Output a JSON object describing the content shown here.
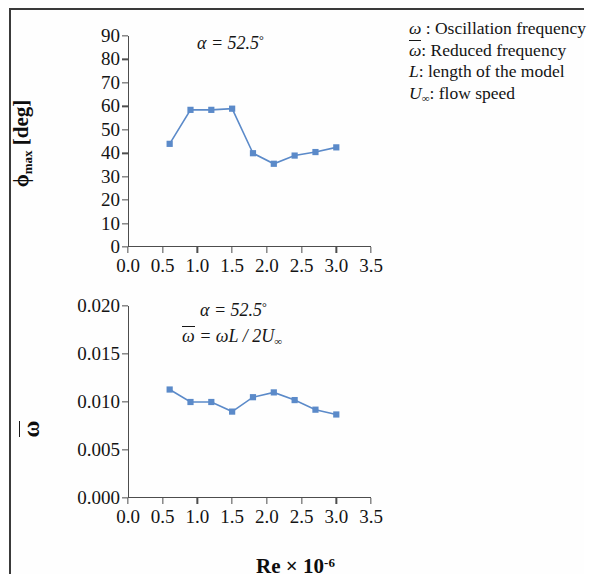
{
  "figure": {
    "legend": [
      {
        "symbol": "ω",
        "overbar": false,
        "subscript": "",
        "text": " : Oscillation frequency"
      },
      {
        "symbol": "ω",
        "overbar": true,
        "subscript": "",
        "text": ": Reduced frequency"
      },
      {
        "symbol": "L",
        "overbar": false,
        "subscript": "",
        "text": ": length of the model"
      },
      {
        "symbol": "U",
        "overbar": false,
        "subscript": "∞",
        "text": ": flow speed"
      }
    ],
    "xaxis_main_label": "Re × 10",
    "xaxis_main_exponent": "-6"
  },
  "chart_data": [
    {
      "type": "line",
      "id": "phi-max-chart",
      "title": "",
      "xlabel": "Re × 10^-6",
      "ylabel": "φmax [deg]",
      "ylabel_base": "ϕ",
      "ylabel_sub": "max",
      "ylabel_unit": "[deg]",
      "annotations": [
        "α = 52.5°"
      ],
      "annotation_alpha": "α = 52.5",
      "annotation_alpha_deg": "°",
      "xlim": [
        0.0,
        3.5
      ],
      "ylim": [
        0,
        90
      ],
      "xticks": [
        "0.0",
        "0.5",
        "1.0",
        "1.5",
        "2.0",
        "2.5",
        "3.0",
        "3.5"
      ],
      "xtick_values": [
        0.0,
        0.5,
        1.0,
        1.5,
        2.0,
        2.5,
        3.0,
        3.5
      ],
      "yticks": [
        "0",
        "10",
        "20",
        "30",
        "40",
        "50",
        "60",
        "70",
        "80",
        "90"
      ],
      "ytick_values": [
        0,
        10,
        20,
        30,
        40,
        50,
        60,
        70,
        80,
        90
      ],
      "grid": false,
      "legend_position": "none",
      "series_color": "#5b8ac9",
      "marker": "square",
      "x": [
        0.6,
        0.9,
        1.2,
        1.5,
        1.8,
        2.1,
        2.4,
        2.7,
        3.0
      ],
      "values": [
        44.0,
        58.5,
        58.5,
        59.0,
        40.0,
        35.5,
        39.0,
        40.5,
        42.5
      ]
    },
    {
      "type": "line",
      "id": "reduced-frequency-chart",
      "title": "",
      "xlabel": "Re × 10^-6",
      "ylabel": "ω̄",
      "annotations": [
        "α = 52.5°",
        "ω̄ = ωL / 2U∞"
      ],
      "annotation_alpha": "α = 52.5",
      "annotation_alpha_deg": "°",
      "annotation_formula_lhs": "ω",
      "annotation_formula_rhs": " = ωL / 2U",
      "annotation_formula_sub": "∞",
      "xlim": [
        0.0,
        3.5
      ],
      "ylim": [
        0.0,
        0.02
      ],
      "xticks": [
        "0.0",
        "0.5",
        "1.0",
        "1.5",
        "2.0",
        "2.5",
        "3.0",
        "3.5"
      ],
      "xtick_values": [
        0.0,
        0.5,
        1.0,
        1.5,
        2.0,
        2.5,
        3.0,
        3.5
      ],
      "yticks": [
        "0.000",
        "0.005",
        "0.010",
        "0.015",
        "0.020"
      ],
      "ytick_values": [
        0.0,
        0.005,
        0.01,
        0.015,
        0.02
      ],
      "grid": false,
      "legend_position": "none",
      "series_color": "#5b8ac9",
      "marker": "square",
      "x": [
        0.6,
        0.9,
        1.2,
        1.5,
        1.8,
        2.1,
        2.4,
        2.7,
        3.0
      ],
      "values": [
        0.0113,
        0.01,
        0.01,
        0.009,
        0.0105,
        0.011,
        0.0102,
        0.0092,
        0.0087
      ]
    }
  ]
}
